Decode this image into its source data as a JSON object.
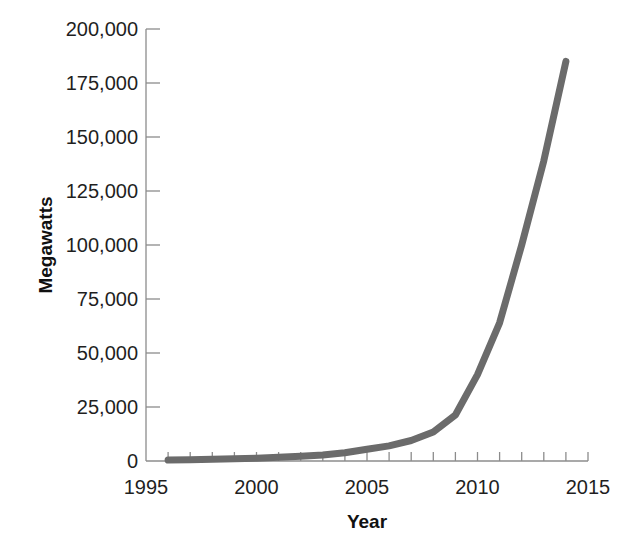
{
  "chart_data": {
    "type": "line",
    "title": "",
    "subtitle": "",
    "xlabel": "Year",
    "ylabel": "Megawatts",
    "xlim": [
      1995,
      2015
    ],
    "ylim": [
      0,
      200000
    ],
    "grid": false,
    "legend": null,
    "legend_position": "none",
    "series_color": "#6b6b6b",
    "x_tick_labels": [
      "1995",
      "2000",
      "2005",
      "2010",
      "2015"
    ],
    "x_major_ticks": [
      1995,
      2000,
      2005,
      2010,
      2015
    ],
    "x_minor_tick_interval": 1,
    "y_tick_labels": [
      "0",
      "25,000",
      "50,000",
      "75,000",
      "100,000",
      "125,000",
      "150,000",
      "175,000",
      "200,000"
    ],
    "y_major_ticks": [
      0,
      25000,
      50000,
      75000,
      100000,
      125000,
      150000,
      175000,
      200000
    ],
    "series": [
      {
        "name": "Cumulative installed capacity",
        "x": [
          1996,
          1997,
          1998,
          1999,
          2000,
          2001,
          2002,
          2003,
          2004,
          2005,
          2006,
          2007,
          2008,
          2009,
          2010,
          2011,
          2012,
          2013,
          2014
        ],
        "values": [
          400,
          600,
          800,
          1000,
          1300,
          1700,
          2200,
          2800,
          3800,
          5400,
          7000,
          9500,
          13400,
          21300,
          40000,
          64000,
          100000,
          139000,
          185000
        ]
      }
    ]
  },
  "axis": {
    "y_title": "Megawatts",
    "x_title": "Year"
  },
  "labels": {
    "y": {
      "t200000": "200,000",
      "t175000": "175,000",
      "t150000": "150,000",
      "t125000": "125,000",
      "t100000": "100,000",
      "t75000": "75,000",
      "t50000": "50,000",
      "t25000": "25,000",
      "t0": "0"
    },
    "x": {
      "t1995": "1995",
      "t2000": "2000",
      "t2005": "2005",
      "t2010": "2010",
      "t2015": "2015"
    }
  }
}
